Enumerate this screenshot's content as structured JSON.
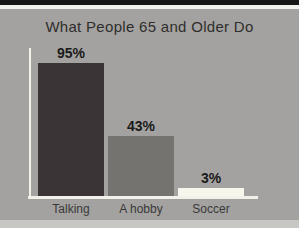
{
  "page": {
    "background_color": "#a3a2a0",
    "top_strip_color": "#161616",
    "top_highlight_color": "#f2f1ee",
    "bottom_strip_color": "#c7c6c3"
  },
  "chart_data": {
    "type": "bar",
    "title": "What People 65 and Older Do",
    "categories": [
      "Talking",
      "A hobby",
      "Soccer"
    ],
    "values": [
      95,
      43,
      3
    ],
    "value_labels": [
      "95%",
      "43%",
      "3%"
    ],
    "bar_colors": [
      "#3b3436",
      "#747370",
      "#f8f6ec"
    ],
    "axis_color": "#f2f1e9",
    "title_color": "#2f2e2c",
    "value_label_color": "#1a1a1a",
    "category_label_color": "#3a3938",
    "xlabel": "",
    "ylabel": "",
    "ylim": [
      0,
      100
    ],
    "grid": false,
    "legend": null
  }
}
